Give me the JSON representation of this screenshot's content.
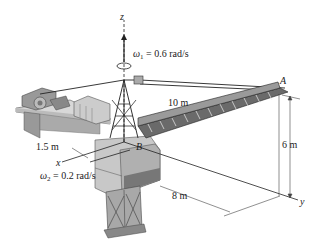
{
  "figure": {
    "axes": {
      "z": "z",
      "x": "x",
      "y": "y"
    },
    "points": {
      "A": "A",
      "B": "B"
    },
    "omega1": {
      "symbol": "ω",
      "sub": "1",
      "text": " = 0.6 rad/s"
    },
    "omega2": {
      "symbol": "ω",
      "sub": "2",
      "text": " = 0.2 rad/s"
    },
    "dimensions": {
      "boom_length": "10 m",
      "height": "6 m",
      "offset": "1.5 m",
      "distance": "8 m"
    },
    "colors": {
      "line": "#222222",
      "steel": "#555555",
      "body": "#c8c8c8",
      "shade": "#8a8a8a"
    }
  }
}
